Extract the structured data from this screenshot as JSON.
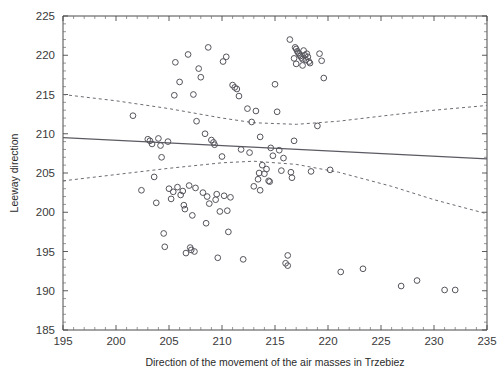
{
  "chart_data": {
    "type": "scatter",
    "title": "",
    "xlabel": "Direction of the movement of the air masses in Trzebiez",
    "ylabel": "Leeway direction",
    "xlim": [
      195,
      235
    ],
    "ylim": [
      185,
      225
    ],
    "xticks": [
      195,
      200,
      205,
      210,
      215,
      220,
      225,
      230,
      235
    ],
    "yticks": [
      185,
      190,
      195,
      200,
      205,
      210,
      215,
      220,
      225
    ],
    "xtick_labels": [
      "195",
      "200",
      "205",
      "210",
      "215",
      "220",
      "225",
      "230",
      "235"
    ],
    "ytick_labels": [
      "185",
      "190",
      "195",
      "200",
      "205",
      "210",
      "215",
      "220",
      "225"
    ],
    "minor_tick_step": 1,
    "grid": false,
    "legend": "none",
    "marker": "open-circle",
    "marker_size": 4,
    "points": [
      [
        201.6,
        212.3
      ],
      [
        202.4,
        202.8
      ],
      [
        203.0,
        209.3
      ],
      [
        203.2,
        209.1
      ],
      [
        203.4,
        208.7
      ],
      [
        203.6,
        204.5
      ],
      [
        203.8,
        201.2
      ],
      [
        204.0,
        209.4
      ],
      [
        204.2,
        208.5
      ],
      [
        204.3,
        207.0
      ],
      [
        204.5,
        197.3
      ],
      [
        204.6,
        195.6
      ],
      [
        205.0,
        203.0
      ],
      [
        205.2,
        201.7
      ],
      [
        205.4,
        202.6
      ],
      [
        205.6,
        219.1
      ],
      [
        205.8,
        203.2
      ],
      [
        206.0,
        216.6
      ],
      [
        206.1,
        202.2
      ],
      [
        206.3,
        202.7
      ],
      [
        206.4,
        200.9
      ],
      [
        206.5,
        200.4
      ],
      [
        206.6,
        194.8
      ],
      [
        206.8,
        220.1
      ],
      [
        206.9,
        203.4
      ],
      [
        207.0,
        195.5
      ],
      [
        207.1,
        195.2
      ],
      [
        207.2,
        199.6
      ],
      [
        207.3,
        215.0
      ],
      [
        207.4,
        195.0
      ],
      [
        207.5,
        203.1
      ],
      [
        207.6,
        211.6
      ],
      [
        207.8,
        218.3
      ],
      [
        208.0,
        217.2
      ],
      [
        208.2,
        202.5
      ],
      [
        208.4,
        210.0
      ],
      [
        208.5,
        198.6
      ],
      [
        208.6,
        202.0
      ],
      [
        208.8,
        201.1
      ],
      [
        209.0,
        209.2
      ],
      [
        209.2,
        208.9
      ],
      [
        209.3,
        208.6
      ],
      [
        209.4,
        201.6
      ],
      [
        209.5,
        202.3
      ],
      [
        209.6,
        194.2
      ],
      [
        209.8,
        200.1
      ],
      [
        210.0,
        207.1
      ],
      [
        210.2,
        202.1
      ],
      [
        210.4,
        219.8
      ],
      [
        210.5,
        200.2
      ],
      [
        210.6,
        197.5
      ],
      [
        210.8,
        201.9
      ],
      [
        211.0,
        216.2
      ],
      [
        211.2,
        215.9
      ],
      [
        211.4,
        215.7
      ],
      [
        211.6,
        214.8
      ],
      [
        211.8,
        208.0
      ],
      [
        212.0,
        194.0
      ],
      [
        212.4,
        213.2
      ],
      [
        212.6,
        207.6
      ],
      [
        212.8,
        211.5
      ],
      [
        213.0,
        203.3
      ],
      [
        213.2,
        212.9
      ],
      [
        213.4,
        204.2
      ],
      [
        213.5,
        205.0
      ],
      [
        213.6,
        209.6
      ],
      [
        213.8,
        206.0
      ],
      [
        214.0,
        204.9
      ],
      [
        214.2,
        205.5
      ],
      [
        214.4,
        204.0
      ],
      [
        214.5,
        203.9
      ],
      [
        214.6,
        208.2
      ],
      [
        214.8,
        207.2
      ],
      [
        215.0,
        216.3
      ],
      [
        215.2,
        212.8
      ],
      [
        215.4,
        207.9
      ],
      [
        215.6,
        205.3
      ],
      [
        215.8,
        206.9
      ],
      [
        216.0,
        193.5
      ],
      [
        216.2,
        194.5
      ],
      [
        216.4,
        222.0
      ],
      [
        216.5,
        205.1
      ],
      [
        216.6,
        204.4
      ],
      [
        216.8,
        209.1
      ],
      [
        216.9,
        221.0
      ],
      [
        217.0,
        220.8
      ],
      [
        217.1,
        220.5
      ],
      [
        217.2,
        220.3
      ],
      [
        217.3,
        220.1
      ],
      [
        217.4,
        219.9
      ],
      [
        217.5,
        219.7
      ],
      [
        217.6,
        219.5
      ],
      [
        217.7,
        220.6
      ],
      [
        217.8,
        220.0
      ],
      [
        217.9,
        219.4
      ],
      [
        218.0,
        220.2
      ],
      [
        218.1,
        219.8
      ],
      [
        218.2,
        219.2
      ],
      [
        218.3,
        219.0
      ],
      [
        216.8,
        219.6
      ],
      [
        217.0,
        218.9
      ],
      [
        217.6,
        218.7
      ],
      [
        218.4,
        205.2
      ],
      [
        219.0,
        211.0
      ],
      [
        219.2,
        220.2
      ],
      [
        219.4,
        219.3
      ],
      [
        219.6,
        217.1
      ],
      [
        220.2,
        205.4
      ],
      [
        221.2,
        192.4
      ],
      [
        223.3,
        192.8
      ],
      [
        226.9,
        190.6
      ],
      [
        228.4,
        191.3
      ],
      [
        231.0,
        190.1
      ],
      [
        232.0,
        190.1
      ],
      [
        216.2,
        193.2
      ],
      [
        213.6,
        202.8
      ],
      [
        208.7,
        221.0
      ],
      [
        210.1,
        219.2
      ],
      [
        205.5,
        214.9
      ],
      [
        204.9,
        209.0
      ]
    ],
    "fit_line": {
      "label": "regression-line",
      "style": "solid",
      "x": [
        195,
        235
      ],
      "y": [
        209.5,
        206.8
      ]
    },
    "confidence_bands": [
      {
        "label": "upper-confidence-band",
        "style": "dashed",
        "x": [
          195,
          200,
          205,
          210,
          213,
          217,
          221,
          226,
          230,
          235
        ],
        "y": [
          215.0,
          214.2,
          213.2,
          212.0,
          211.4,
          211.2,
          211.6,
          212.4,
          213.0,
          213.6
        ]
      },
      {
        "label": "lower-confidence-band",
        "style": "dashed",
        "x": [
          195,
          200,
          205,
          210,
          213,
          217,
          221,
          226,
          230,
          235
        ],
        "y": [
          204.0,
          204.8,
          205.6,
          206.3,
          206.5,
          206.1,
          205.1,
          203.3,
          201.6,
          199.8
        ]
      }
    ]
  },
  "axes": {
    "x_title": "Direction of the movement of the air masses in Trzebiez",
    "y_title": "Leeway direction"
  }
}
